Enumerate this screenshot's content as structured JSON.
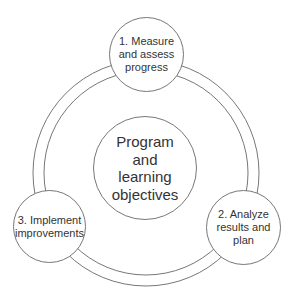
{
  "diagram": {
    "type": "cycle",
    "center": {
      "label": "Program\nand\nlearning\nobjectives"
    },
    "steps": [
      {
        "label": "1. Measure\nand assess\nprogress"
      },
      {
        "label": "2. Analyze\nresults and\nplan"
      },
      {
        "label": "3. Implement\nimprovements"
      }
    ],
    "colors": {
      "stroke": "#777777",
      "text": "#333333",
      "background": "#ffffff"
    }
  }
}
